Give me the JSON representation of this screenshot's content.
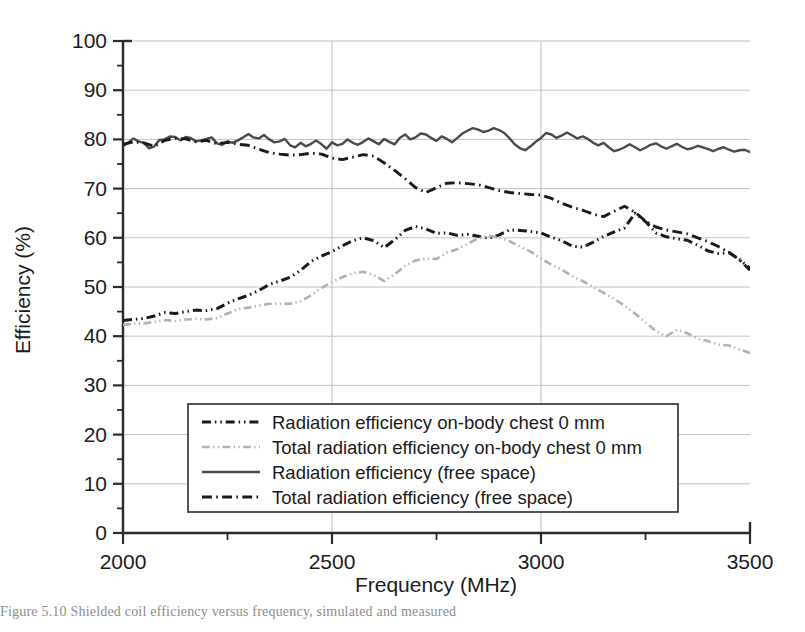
{
  "figure": {
    "caption": "Figure 5.10   Shielded coil efficiency versus frequency, simulated and measured",
    "caption_label": "Figure 5.10"
  },
  "chart_data": {
    "type": "line",
    "title": "",
    "xlabel": "Frequency (MHz)",
    "ylabel": "Efficiency (%)",
    "xlim": [
      2000,
      3500
    ],
    "ylim": [
      0,
      100
    ],
    "xticks": [
      2000,
      2500,
      3000,
      3500
    ],
    "xtick_labels": [
      "2000",
      "2500",
      "3000",
      "3500"
    ],
    "xminor_step": 250,
    "yticks": [
      0,
      10,
      20,
      30,
      40,
      50,
      60,
      70,
      80,
      90,
      100
    ],
    "ytick_labels": [
      "0",
      "10",
      "20",
      "30",
      "40",
      "50",
      "60",
      "70",
      "80",
      "90",
      "100"
    ],
    "yminor_step": 5,
    "grid": {
      "horizontal": true,
      "vertical_at": [
        2500,
        3000
      ]
    },
    "legend_position": "lower-center",
    "series": [
      {
        "name": "Radiation efficiency on-body chest 0 mm",
        "style": "dash-dot-dot",
        "color": "#1a1a1a",
        "width": 3.0,
        "x": [
          2000,
          2025,
          2050,
          2075,
          2100,
          2125,
          2150,
          2175,
          2200,
          2225,
          2250,
          2275,
          2300,
          2325,
          2350,
          2375,
          2400,
          2425,
          2450,
          2475,
          2500,
          2525,
          2550,
          2575,
          2600,
          2625,
          2650,
          2675,
          2700,
          2725,
          2750,
          2775,
          2800,
          2825,
          2850,
          2875,
          2900,
          2925,
          2950,
          2975,
          3000,
          3025,
          3050,
          3075,
          3100,
          3125,
          3150,
          3175,
          3200,
          3225,
          3250,
          3275,
          3300,
          3325,
          3350,
          3375,
          3400,
          3425,
          3450,
          3475,
          3500
        ],
        "y": [
          43.2,
          43.4,
          43.6,
          44.1,
          44.8,
          44.6,
          45.0,
          45.3,
          45.2,
          45.6,
          46.7,
          47.6,
          48.3,
          49.3,
          50.5,
          51.2,
          52.0,
          53.4,
          55.2,
          56.3,
          57.2,
          58.4,
          59.4,
          60.0,
          59.4,
          58.0,
          59.6,
          61.5,
          62.3,
          61.8,
          60.9,
          61.0,
          60.5,
          60.7,
          60.3,
          59.9,
          60.6,
          61.6,
          61.5,
          61.3,
          61.0,
          60.1,
          59.4,
          58.3,
          58.1,
          59.1,
          60.3,
          61.2,
          62.0,
          65.0,
          63.3,
          61.0,
          60.2,
          59.8,
          59.5,
          58.5,
          57.3,
          56.8,
          57.0,
          55.6,
          53.8
        ]
      },
      {
        "name": "Total radiation efficiency on-body chest 0 mm",
        "style": "dash-dot-dot",
        "color": "#b2b2b2",
        "width": 2.6,
        "x": [
          2000,
          2025,
          2050,
          2075,
          2100,
          2125,
          2150,
          2175,
          2200,
          2225,
          2250,
          2275,
          2300,
          2325,
          2350,
          2375,
          2400,
          2425,
          2450,
          2475,
          2500,
          2525,
          2550,
          2575,
          2600,
          2625,
          2650,
          2675,
          2700,
          2725,
          2750,
          2775,
          2800,
          2825,
          2850,
          2875,
          2900,
          2925,
          2950,
          2975,
          3000,
          3025,
          3050,
          3075,
          3100,
          3125,
          3150,
          3175,
          3200,
          3225,
          3250,
          3275,
          3300,
          3325,
          3350,
          3375,
          3400,
          3425,
          3450,
          3475,
          3500
        ],
        "y": [
          42.3,
          42.5,
          42.6,
          42.9,
          43.3,
          43.1,
          43.4,
          43.5,
          43.4,
          43.7,
          44.6,
          45.5,
          45.8,
          46.2,
          46.6,
          46.6,
          46.6,
          47.1,
          48.3,
          49.8,
          51.0,
          52.0,
          52.8,
          53.1,
          52.4,
          51.2,
          52.6,
          54.3,
          55.4,
          55.8,
          55.7,
          57.0,
          57.7,
          58.8,
          59.9,
          60.4,
          60.1,
          59.3,
          58.2,
          57.2,
          55.8,
          54.5,
          53.5,
          52.2,
          51.2,
          50.0,
          48.8,
          47.6,
          46.2,
          44.6,
          42.8,
          41.0,
          40.0,
          41.3,
          40.6,
          39.5,
          39.0,
          38.3,
          38.1,
          37.3,
          36.6
        ]
      },
      {
        "name": "Radiation efficiency (free space)",
        "style": "solid",
        "color": "#4a4a4a",
        "width": 2.4,
        "x": [
          2000,
          2012,
          2025,
          2037,
          2050,
          2062,
          2075,
          2087,
          2100,
          2112,
          2125,
          2137,
          2150,
          2162,
          2175,
          2187,
          2200,
          2212,
          2225,
          2237,
          2250,
          2262,
          2275,
          2287,
          2300,
          2312,
          2325,
          2337,
          2350,
          2362,
          2375,
          2387,
          2400,
          2412,
          2425,
          2437,
          2450,
          2462,
          2475,
          2487,
          2500,
          2512,
          2525,
          2537,
          2550,
          2562,
          2575,
          2587,
          2600,
          2612,
          2625,
          2637,
          2650,
          2662,
          2675,
          2687,
          2700,
          2712,
          2725,
          2737,
          2750,
          2762,
          2775,
          2787,
          2800,
          2812,
          2825,
          2837,
          2850,
          2862,
          2875,
          2887,
          2900,
          2912,
          2925,
          2937,
          2950,
          2962,
          2975,
          2987,
          3000,
          3012,
          3025,
          3037,
          3050,
          3062,
          3075,
          3087,
          3100,
          3112,
          3125,
          3137,
          3150,
          3162,
          3175,
          3187,
          3200,
          3212,
          3225,
          3237,
          3250,
          3262,
          3275,
          3287,
          3300,
          3312,
          3325,
          3337,
          3350,
          3362,
          3375,
          3387,
          3400,
          3412,
          3425,
          3437,
          3450,
          3462,
          3475,
          3487,
          3500
        ],
        "y": [
          78.6,
          79.3,
          80.2,
          79.6,
          79.3,
          78.2,
          78.6,
          79.9,
          80.0,
          80.6,
          80.5,
          79.8,
          80.5,
          80.3,
          79.6,
          79.8,
          80.1,
          80.4,
          79.2,
          78.9,
          79.6,
          79.3,
          79.8,
          80.4,
          81.1,
          80.4,
          80.2,
          80.9,
          80.0,
          79.4,
          79.6,
          80.1,
          78.8,
          78.4,
          79.3,
          78.6,
          79.1,
          79.8,
          79.0,
          78.1,
          79.4,
          78.8,
          79.1,
          80.0,
          79.3,
          78.9,
          79.5,
          80.2,
          79.6,
          79.0,
          80.1,
          79.5,
          79.0,
          80.3,
          81.0,
          80.0,
          80.4,
          81.2,
          81.0,
          80.3,
          79.7,
          80.6,
          80.1,
          79.4,
          80.3,
          81.2,
          81.8,
          82.3,
          82.0,
          81.5,
          81.8,
          82.3,
          81.9,
          81.3,
          80.2,
          79.0,
          78.2,
          77.8,
          78.6,
          79.5,
          80.3,
          81.3,
          81.0,
          80.3,
          80.8,
          81.4,
          80.8,
          80.2,
          80.6,
          80.1,
          79.3,
          78.8,
          79.3,
          78.4,
          77.6,
          77.9,
          78.4,
          79.0,
          78.4,
          77.8,
          78.3,
          78.9,
          79.2,
          78.6,
          78.1,
          78.6,
          79.1,
          78.5,
          78.0,
          78.2,
          78.7,
          78.4,
          78.0,
          77.6,
          78.1,
          78.4,
          77.9,
          77.5,
          77.8,
          77.9,
          77.4
        ]
      },
      {
        "name": "Total radiation efficiency (free space)",
        "style": "dash-dot",
        "color": "#1a1a1a",
        "width": 2.9,
        "x": [
          2000,
          2025,
          2050,
          2075,
          2100,
          2125,
          2150,
          2175,
          2200,
          2225,
          2250,
          2275,
          2300,
          2325,
          2350,
          2375,
          2400,
          2425,
          2450,
          2475,
          2500,
          2525,
          2550,
          2575,
          2600,
          2625,
          2650,
          2675,
          2700,
          2725,
          2750,
          2775,
          2800,
          2825,
          2850,
          2875,
          2900,
          2925,
          2950,
          2975,
          3000,
          3025,
          3050,
          3075,
          3100,
          3125,
          3150,
          3175,
          3200,
          3225,
          3250,
          3275,
          3300,
          3325,
          3350,
          3375,
          3400,
          3425,
          3450,
          3475,
          3500
        ],
        "y": [
          79.0,
          79.5,
          79.3,
          78.6,
          79.8,
          80.2,
          80.1,
          79.5,
          79.8,
          79.1,
          79.4,
          79.0,
          78.8,
          78.0,
          77.3,
          77.0,
          76.8,
          76.9,
          77.2,
          77.0,
          76.2,
          75.9,
          76.4,
          76.9,
          76.6,
          75.2,
          73.7,
          72.0,
          70.2,
          69.2,
          70.2,
          71.1,
          71.2,
          71.0,
          70.8,
          70.2,
          69.6,
          69.2,
          69.0,
          68.8,
          68.7,
          68.0,
          67.0,
          66.2,
          65.6,
          64.8,
          64.3,
          65.4,
          66.4,
          65.2,
          63.4,
          62.2,
          61.6,
          61.2,
          60.8,
          60.0,
          59.2,
          58.2,
          57.0,
          55.5,
          53.4
        ]
      }
    ]
  }
}
